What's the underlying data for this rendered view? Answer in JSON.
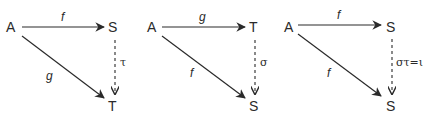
{
  "diagrams": [
    {
      "nodes": {
        "source": "A",
        "top_right": "S",
        "bottom_right": "T"
      },
      "arrows": {
        "horizontal": "f",
        "diagonal": "g",
        "vertical_dashed": "τ"
      }
    },
    {
      "nodes": {
        "source": "A",
        "top_right": "T",
        "bottom_right": "S"
      },
      "arrows": {
        "horizontal": "g",
        "diagonal": "f",
        "vertical_dashed": "σ"
      }
    },
    {
      "nodes": {
        "source": "A",
        "top_right": "S",
        "bottom_right": "S"
      },
      "arrows": {
        "horizontal": "f",
        "diagonal": "f",
        "vertical_dashed": "στ=ι"
      }
    }
  ],
  "colors": {
    "stroke": "#2a2a2a",
    "background": "#ffffff"
  }
}
